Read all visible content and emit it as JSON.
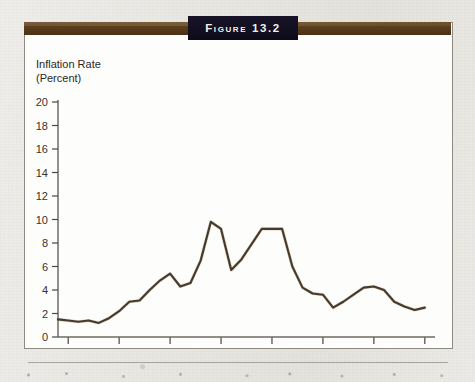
{
  "figure": {
    "label": "Figure 13.2",
    "header_bar_color": "#5a3c1c",
    "title_box_color": "#120f20",
    "panel_color": "#fdfdfc",
    "line_color": "#3d2f1f"
  },
  "chart_data": {
    "type": "line",
    "title": "Figure 13.2",
    "xlabel": "",
    "ylabel": "Inflation Rate (Percent)",
    "ylabel_line1": "Inflation Rate",
    "ylabel_line2": "(Percent)",
    "xlim": [
      1959,
      1996
    ],
    "ylim": [
      0,
      20
    ],
    "grid": false,
    "legend": "none",
    "yticks": [
      0,
      2,
      4,
      6,
      8,
      10,
      12,
      14,
      16,
      18,
      20
    ],
    "ytick_labels": [
      "0",
      "2",
      "4",
      "6",
      "8",
      "10",
      "12",
      "14",
      "16",
      "18",
      "20"
    ],
    "xticks": [
      1960,
      1965,
      1970,
      1975,
      1980,
      1985,
      1990,
      1995
    ],
    "xtick_labels": [
      "1960",
      "1965",
      "1970",
      "1975",
      "1980",
      "1985",
      "1990",
      "1995"
    ],
    "x": [
      1959,
      1960,
      1961,
      1962,
      1963,
      1964,
      1965,
      1966,
      1967,
      1968,
      1969,
      1970,
      1971,
      1972,
      1973,
      1974,
      1975,
      1976,
      1977,
      1978,
      1979,
      1980,
      1981,
      1982,
      1983,
      1984,
      1985,
      1986,
      1987,
      1988,
      1989,
      1990,
      1991,
      1992,
      1993,
      1994,
      1995
    ],
    "values": [
      1.5,
      1.4,
      1.3,
      1.4,
      1.2,
      1.6,
      2.2,
      3.0,
      3.1,
      4.0,
      4.8,
      5.4,
      4.3,
      4.6,
      6.5,
      9.8,
      9.2,
      5.7,
      6.6,
      7.9,
      9.2,
      9.2,
      9.2,
      6.0,
      4.2,
      3.7,
      3.6,
      2.5,
      3.0,
      3.6,
      4.2,
      4.3,
      4.0,
      3.0,
      2.6,
      2.3,
      2.5
    ],
    "series": [
      {
        "name": "Inflation Rate",
        "values": [
          1.5,
          1.4,
          1.3,
          1.4,
          1.2,
          1.6,
          2.2,
          3.0,
          3.1,
          4.0,
          4.8,
          5.4,
          4.3,
          4.6,
          6.5,
          9.8,
          9.2,
          5.7,
          6.6,
          7.9,
          9.2,
          9.2,
          9.2,
          6.0,
          4.2,
          3.7,
          3.6,
          2.5,
          3.0,
          3.6,
          4.2,
          4.3,
          4.0,
          3.0,
          2.6,
          2.3,
          2.5
        ]
      }
    ]
  }
}
